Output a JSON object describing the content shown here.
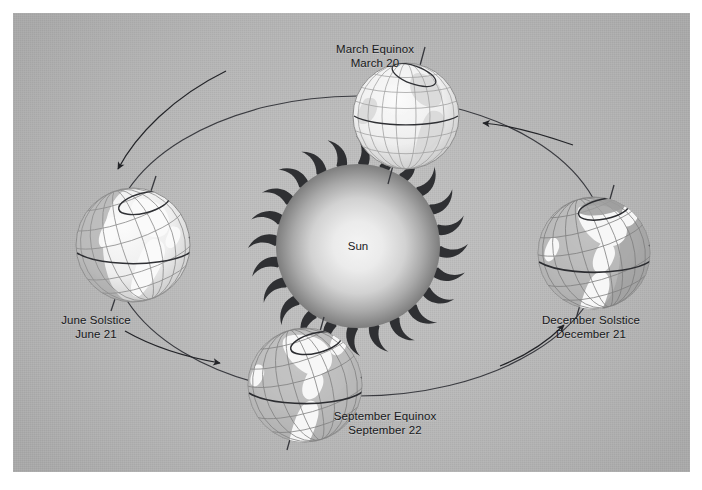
{
  "figure": {
    "background_color": "#bdbdbd",
    "frame_color": "#ffffff",
    "line_color": "#2b2b2b"
  },
  "sun": {
    "label": "Sun",
    "center_color": "#f0f0f0",
    "edge_color": "#6e6e6e",
    "corona_color": "#2f3033"
  },
  "orbit": {
    "type": "ellipse",
    "direction": "counterclockwise",
    "stroke": "#33343a"
  },
  "positions": [
    {
      "id": "march-equinox",
      "name": "March Equinox",
      "date": "March 20",
      "orbit_angle_deg": 90,
      "axis_tilt_deg": 23.5,
      "lit_side": "equator",
      "globe_style": "pale"
    },
    {
      "id": "june-solstice",
      "name": "June Solstice",
      "date": "June 21",
      "orbit_angle_deg": 180,
      "axis_tilt_deg": 23.5,
      "lit_side": "northern-hemisphere",
      "globe_style": "pale"
    },
    {
      "id": "september-equinox",
      "name": "September Equinox",
      "date": "September 22",
      "orbit_angle_deg": 270,
      "axis_tilt_deg": 23.5,
      "lit_side": "equator",
      "globe_style": "contrast"
    },
    {
      "id": "december-solstice",
      "name": "December Solstice",
      "date": "December 21",
      "orbit_angle_deg": 0,
      "axis_tilt_deg": 23.5,
      "lit_side": "southern-hemisphere",
      "globe_style": "contrast"
    }
  ],
  "arrows": [
    {
      "id": "arrow-to-march",
      "points_to": "march-equinox"
    },
    {
      "id": "arrow-to-june",
      "points_to": "june-solstice"
    },
    {
      "id": "arrow-to-september",
      "points_to": "september-equinox"
    },
    {
      "id": "arrow-to-december",
      "points_to": "december-solstice"
    }
  ]
}
